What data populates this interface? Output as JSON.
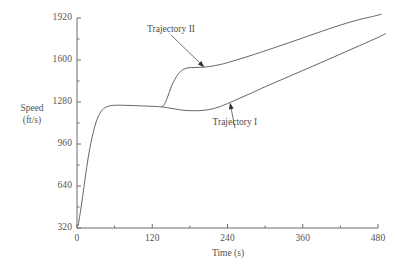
{
  "chart_data": {
    "type": "line",
    "title": "",
    "xlabel": "Time (s)",
    "ylabel": "Speed (ft/s)",
    "ylabel_line1": "Speed",
    "ylabel_line2": "(ft/s)",
    "xlim": [
      0,
      480
    ],
    "ylim": [
      320,
      1920
    ],
    "xticks": [
      0,
      120,
      240,
      360,
      480
    ],
    "xtick_labels": [
      "0",
      "120",
      "240",
      "360",
      "480"
    ],
    "xminor_ticks": [
      60,
      180,
      300,
      420
    ],
    "yticks": [
      320,
      640,
      960,
      1280,
      1600,
      1920
    ],
    "ytick_labels": [
      "320",
      "640",
      "960",
      "1280",
      "1600",
      "1920"
    ],
    "yminor_ticks": [
      480,
      800,
      1120,
      1440,
      1760
    ],
    "grid": false,
    "legend": "annotations",
    "line_color": "#555454",
    "series": [
      {
        "name": "Trajectory I",
        "annotation": "Trajectory I",
        "points": [
          [
            2,
            340
          ],
          [
            5,
            430
          ],
          [
            9,
            560
          ],
          [
            13,
            700
          ],
          [
            18,
            860
          ],
          [
            24,
            1010
          ],
          [
            30,
            1120
          ],
          [
            36,
            1190
          ],
          [
            42,
            1228
          ],
          [
            50,
            1248
          ],
          [
            60,
            1255
          ],
          [
            75,
            1255
          ],
          [
            90,
            1253
          ],
          [
            105,
            1250
          ],
          [
            120,
            1247
          ],
          [
            135,
            1243
          ],
          [
            145,
            1236
          ],
          [
            155,
            1228
          ],
          [
            168,
            1218
          ],
          [
            180,
            1214
          ],
          [
            195,
            1214
          ],
          [
            210,
            1222
          ],
          [
            225,
            1240
          ],
          [
            240,
            1268
          ],
          [
            260,
            1310
          ],
          [
            280,
            1352
          ],
          [
            300,
            1396
          ],
          [
            330,
            1458
          ],
          [
            360,
            1520
          ],
          [
            390,
            1582
          ],
          [
            420,
            1645
          ],
          [
            450,
            1708
          ],
          [
            480,
            1772
          ],
          [
            492,
            1800
          ]
        ]
      },
      {
        "name": "Trajectory II",
        "annotation": "Trajectory II",
        "points": [
          [
            135,
            1243
          ],
          [
            139,
            1258
          ],
          [
            143,
            1300
          ],
          [
            147,
            1352
          ],
          [
            151,
            1404
          ],
          [
            156,
            1452
          ],
          [
            161,
            1490
          ],
          [
            166,
            1516
          ],
          [
            171,
            1532
          ],
          [
            177,
            1540
          ],
          [
            185,
            1543
          ],
          [
            195,
            1544
          ],
          [
            205,
            1547
          ],
          [
            215,
            1553
          ],
          [
            228,
            1565
          ],
          [
            240,
            1580
          ],
          [
            260,
            1608
          ],
          [
            280,
            1638
          ],
          [
            300,
            1670
          ],
          [
            330,
            1718
          ],
          [
            360,
            1768
          ],
          [
            390,
            1818
          ],
          [
            420,
            1866
          ],
          [
            450,
            1908
          ],
          [
            470,
            1930
          ],
          [
            485,
            1948
          ]
        ]
      }
    ],
    "annotations": [
      {
        "text": "Trajectory II",
        "target_x": 203,
        "target_y": 1545,
        "label_x": 150,
        "label_y": 1790
      },
      {
        "text": "Trajectory I",
        "target_x": 244,
        "target_y": 1275,
        "label_x": 252,
        "label_y": 1080
      }
    ]
  },
  "axes": {
    "x_title": "Time (s)",
    "y_title_line1": "Speed",
    "y_title_line2": "(ft/s)"
  }
}
